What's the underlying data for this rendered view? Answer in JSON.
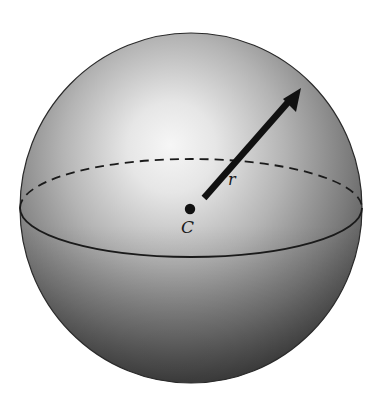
{
  "diagram": {
    "labels": {
      "center": "C",
      "radius": "r"
    },
    "shapes": {
      "sphere": {
        "cx": 191,
        "cy": 208,
        "rx": 171,
        "ry": 175
      },
      "equator": {
        "cx": 191,
        "cy": 208,
        "rx": 171,
        "ry": 49,
        "front_style": "solid",
        "back_style": "dashed"
      },
      "center_point": {
        "cx": 190,
        "cy": 209,
        "r": 5
      },
      "radius_arrow": {
        "x1": 204,
        "y1": 198,
        "x2": 301,
        "y2": 88
      }
    },
    "colors": {
      "highlight": "#f4f4f4",
      "mid": "#9a9a9a",
      "shadow": "#3c3c3c",
      "outline": "#2a2a2a",
      "line": "#111111"
    }
  }
}
